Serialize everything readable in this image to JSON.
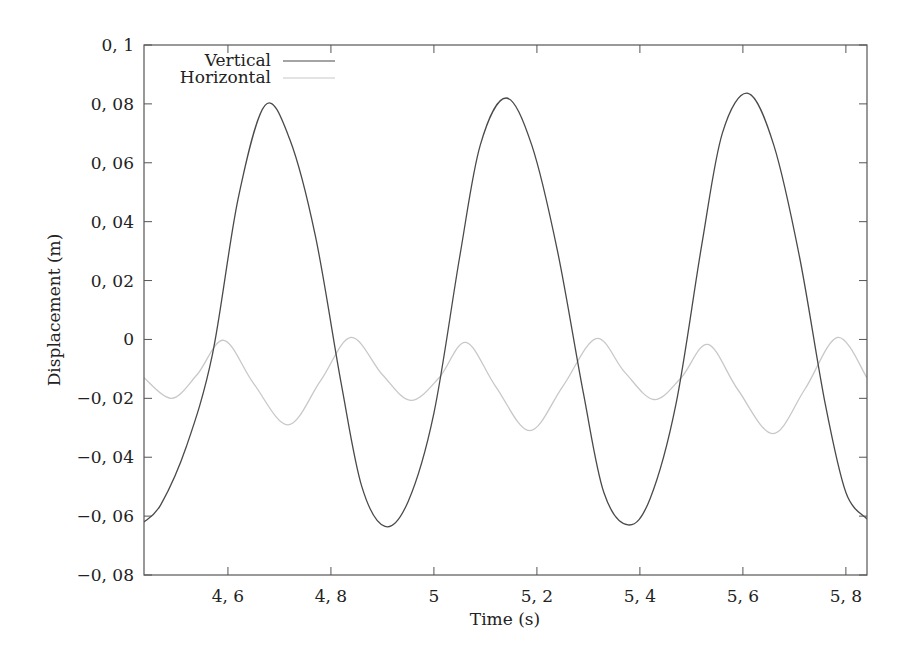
{
  "chart_data": {
    "type": "line",
    "title": "",
    "xlabel": "Time (s)",
    "ylabel": "Displacement (m)",
    "xlim": [
      4.437,
      5.841
    ],
    "ylim": [
      -0.08,
      0.1
    ],
    "grid": false,
    "legend_position": "top-left",
    "x_ticks": [
      {
        "value": 4.6,
        "label": "4, 6"
      },
      {
        "value": 4.8,
        "label": "4, 8"
      },
      {
        "value": 5.0,
        "label": "5"
      },
      {
        "value": 5.2,
        "label": "5, 2"
      },
      {
        "value": 5.4,
        "label": "5, 4"
      },
      {
        "value": 5.6,
        "label": "5, 6"
      },
      {
        "value": 5.8,
        "label": "5, 8"
      }
    ],
    "y_ticks": [
      {
        "value": 0.1,
        "label": "0, 1"
      },
      {
        "value": 0.08,
        "label": "0, 08"
      },
      {
        "value": 0.06,
        "label": "0, 06"
      },
      {
        "value": 0.04,
        "label": "0, 04"
      },
      {
        "value": 0.02,
        "label": "0, 02"
      },
      {
        "value": 0.0,
        "label": "0"
      },
      {
        "value": -0.02,
        "label": "−0, 02"
      },
      {
        "value": -0.04,
        "label": "−0, 04"
      },
      {
        "value": -0.06,
        "label": "−0, 06"
      },
      {
        "value": -0.08,
        "label": "−0, 08"
      }
    ],
    "series": [
      {
        "name": "Vertical",
        "color": "#4a4a4a",
        "x": [
          4.437,
          4.47,
          4.52,
          4.57,
          4.62,
          4.672,
          4.72,
          4.77,
          4.82,
          4.86,
          4.905,
          4.95,
          5.0,
          5.05,
          5.09,
          5.14,
          5.19,
          5.24,
          5.29,
          5.33,
          5.377,
          5.42,
          5.47,
          5.52,
          5.56,
          5.61,
          5.66,
          5.71,
          5.76,
          5.8,
          5.841
        ],
        "values": [
          -0.062,
          -0.056,
          -0.036,
          -0.005,
          0.048,
          0.0795,
          0.068,
          0.035,
          -0.015,
          -0.05,
          -0.0635,
          -0.055,
          -0.025,
          0.028,
          0.066,
          0.082,
          0.066,
          0.03,
          -0.018,
          -0.052,
          -0.063,
          -0.054,
          -0.022,
          0.032,
          0.07,
          0.0836,
          0.066,
          0.028,
          -0.022,
          -0.052,
          -0.061
        ]
      },
      {
        "name": "Horizontal",
        "color": "#c8c8c8",
        "x": [
          4.437,
          4.49,
          4.54,
          4.592,
          4.65,
          4.717,
          4.78,
          4.839,
          4.9,
          4.955,
          5.01,
          5.062,
          5.12,
          5.186,
          5.25,
          5.315,
          5.37,
          5.427,
          5.48,
          5.532,
          5.59,
          5.658,
          5.72,
          5.784,
          5.841
        ],
        "values": [
          -0.013,
          -0.02,
          -0.012,
          -0.0003,
          -0.015,
          -0.029,
          -0.014,
          0.0007,
          -0.012,
          -0.0207,
          -0.013,
          -0.001,
          -0.016,
          -0.031,
          -0.016,
          0.0003,
          -0.011,
          -0.0204,
          -0.013,
          -0.0017,
          -0.017,
          -0.032,
          -0.017,
          0.0007,
          -0.013
        ]
      }
    ]
  },
  "legend": {
    "items": [
      {
        "label": "Vertical",
        "color": "#4a4a4a"
      },
      {
        "label": "Horizontal",
        "color": "#c8c8c8"
      }
    ]
  },
  "axes": {
    "xlabel": "Time (s)",
    "ylabel": "Displacement (m)"
  }
}
